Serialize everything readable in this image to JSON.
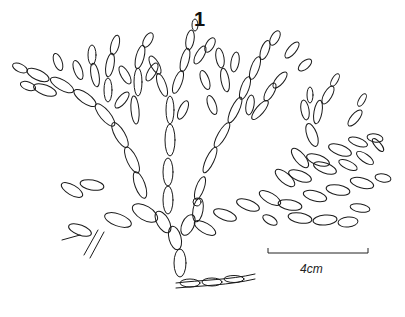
{
  "figure": {
    "number": "1"
  },
  "scale_bar": {
    "label": "4cm",
    "length_px": 100
  },
  "colors": {
    "ink": "#1a1a1a",
    "background": "#ffffff"
  }
}
